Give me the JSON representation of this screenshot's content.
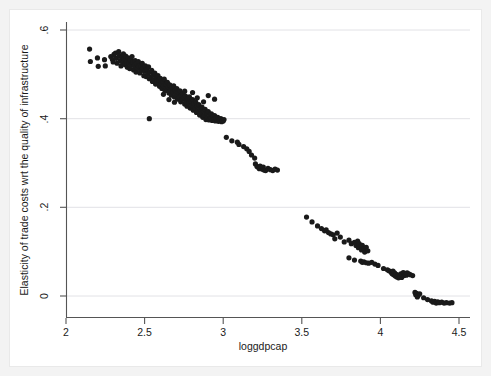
{
  "chart_data": {
    "type": "scatter",
    "title": "",
    "xlabel": "loggdpcap",
    "ylabel": "Elasticity of trade costs wrt the quality of infrastructure",
    "xlim": [
      2,
      4.5
    ],
    "ylim": [
      -0.04,
      0.64
    ],
    "xticks": [
      2,
      2.5,
      3,
      3.5,
      4,
      4.5
    ],
    "xtick_labels": [
      "2",
      "2.5",
      "3",
      "3.5",
      "4",
      "4.5"
    ],
    "yticks": [
      0,
      0.2,
      0.4,
      0.6
    ],
    "ytick_labels": [
      "0",
      ".2",
      ".4",
      ".6"
    ],
    "grid": "horizontal",
    "legend": "none",
    "marker": {
      "shape": "circle",
      "color": "#1a1a1a",
      "size_px": 5.2
    },
    "points": [
      [
        2.15,
        0.557
      ],
      [
        2.155,
        0.529
      ],
      [
        2.2,
        0.537
      ],
      [
        2.205,
        0.518
      ],
      [
        2.245,
        0.533
      ],
      [
        2.25,
        0.519
      ],
      [
        2.285,
        0.54
      ],
      [
        2.295,
        0.534
      ],
      [
        2.3,
        0.528
      ],
      [
        2.305,
        0.545
      ],
      [
        2.315,
        0.548
      ],
      [
        2.32,
        0.536
      ],
      [
        2.325,
        0.525
      ],
      [
        2.335,
        0.551
      ],
      [
        2.34,
        0.542
      ],
      [
        2.345,
        0.531
      ],
      [
        2.35,
        0.519
      ],
      [
        2.355,
        0.538
      ],
      [
        2.36,
        0.527
      ],
      [
        2.365,
        0.546
      ],
      [
        2.37,
        0.534
      ],
      [
        2.375,
        0.522
      ],
      [
        2.38,
        0.541
      ],
      [
        2.385,
        0.53
      ],
      [
        2.39,
        0.516
      ],
      [
        2.395,
        0.537
      ],
      [
        2.4,
        0.525
      ],
      [
        2.405,
        0.513
      ],
      [
        2.41,
        0.533
      ],
      [
        2.415,
        0.521
      ],
      [
        2.42,
        0.54
      ],
      [
        2.425,
        0.528
      ],
      [
        2.43,
        0.51
      ],
      [
        2.435,
        0.519
      ],
      [
        2.44,
        0.531
      ],
      [
        2.445,
        0.505
      ],
      [
        2.45,
        0.524
      ],
      [
        2.455,
        0.513
      ],
      [
        2.46,
        0.529
      ],
      [
        2.465,
        0.518
      ],
      [
        2.47,
        0.503
      ],
      [
        2.475,
        0.521
      ],
      [
        2.48,
        0.509
      ],
      [
        2.485,
        0.525
      ],
      [
        2.49,
        0.514
      ],
      [
        2.495,
        0.497
      ],
      [
        2.5,
        0.507
      ],
      [
        2.505,
        0.519
      ],
      [
        2.51,
        0.495
      ],
      [
        2.515,
        0.511
      ],
      [
        2.52,
        0.501
      ],
      [
        2.525,
        0.517
      ],
      [
        2.53,
        0.49
      ],
      [
        2.535,
        0.505
      ],
      [
        2.54,
        0.494
      ],
      [
        2.545,
        0.509
      ],
      [
        2.55,
        0.484
      ],
      [
        2.555,
        0.499
      ],
      [
        2.56,
        0.488
      ],
      [
        2.565,
        0.503
      ],
      [
        2.57,
        0.478
      ],
      [
        2.575,
        0.493
      ],
      [
        2.58,
        0.482
      ],
      [
        2.585,
        0.497
      ],
      [
        2.59,
        0.487
      ],
      [
        2.595,
        0.473
      ],
      [
        2.6,
        0.491
      ],
      [
        2.605,
        0.479
      ],
      [
        2.61,
        0.468
      ],
      [
        2.615,
        0.484
      ],
      [
        2.62,
        0.474
      ],
      [
        2.625,
        0.489
      ],
      [
        2.63,
        0.463
      ],
      [
        2.635,
        0.478
      ],
      [
        2.64,
        0.468
      ],
      [
        2.645,
        0.482
      ],
      [
        2.65,
        0.472
      ],
      [
        2.655,
        0.458
      ],
      [
        2.66,
        0.476
      ],
      [
        2.665,
        0.465
      ],
      [
        2.67,
        0.453
      ],
      [
        2.675,
        0.47
      ],
      [
        2.68,
        0.46
      ],
      [
        2.685,
        0.474
      ],
      [
        2.69,
        0.449
      ],
      [
        2.695,
        0.464
      ],
      [
        2.7,
        0.454
      ],
      [
        2.705,
        0.468
      ],
      [
        2.71,
        0.444
      ],
      [
        2.715,
        0.459
      ],
      [
        2.72,
        0.449
      ],
      [
        2.725,
        0.463
      ],
      [
        2.73,
        0.438
      ],
      [
        2.735,
        0.453
      ],
      [
        2.74,
        0.443
      ],
      [
        2.745,
        0.457
      ],
      [
        2.75,
        0.447
      ],
      [
        2.755,
        0.433
      ],
      [
        2.76,
        0.451
      ],
      [
        2.765,
        0.44
      ],
      [
        2.77,
        0.428
      ],
      [
        2.775,
        0.445
      ],
      [
        2.78,
        0.435
      ],
      [
        2.785,
        0.449
      ],
      [
        2.79,
        0.424
      ],
      [
        2.795,
        0.439
      ],
      [
        2.8,
        0.429
      ],
      [
        2.805,
        0.443
      ],
      [
        2.81,
        0.419
      ],
      [
        2.815,
        0.434
      ],
      [
        2.82,
        0.424
      ],
      [
        2.825,
        0.438
      ],
      [
        2.83,
        0.414
      ],
      [
        2.835,
        0.428
      ],
      [
        2.84,
        0.418
      ],
      [
        2.845,
        0.432
      ],
      [
        2.85,
        0.408
      ],
      [
        2.855,
        0.422
      ],
      [
        2.86,
        0.412
      ],
      [
        2.865,
        0.426
      ],
      [
        2.87,
        0.403
      ],
      [
        2.875,
        0.417
      ],
      [
        2.88,
        0.407
      ],
      [
        2.885,
        0.421
      ],
      [
        2.89,
        0.398
      ],
      [
        2.895,
        0.412
      ],
      [
        2.9,
        0.402
      ],
      [
        2.905,
        0.416
      ],
      [
        2.91,
        0.397
      ],
      [
        2.915,
        0.407
      ],
      [
        2.92,
        0.4
      ],
      [
        2.925,
        0.411
      ],
      [
        2.93,
        0.396
      ],
      [
        2.935,
        0.404
      ],
      [
        2.94,
        0.398
      ],
      [
        2.945,
        0.407
      ],
      [
        2.95,
        0.395
      ],
      [
        2.955,
        0.401
      ],
      [
        2.96,
        0.397
      ],
      [
        2.965,
        0.403
      ],
      [
        2.97,
        0.394
      ],
      [
        2.975,
        0.399
      ],
      [
        2.98,
        0.396
      ],
      [
        2.985,
        0.4
      ],
      [
        2.99,
        0.393
      ],
      [
        2.995,
        0.397
      ],
      [
        3.0,
        0.395
      ],
      [
        3.005,
        0.398
      ],
      [
        2.53,
        0.4
      ],
      [
        2.62,
        0.455
      ],
      [
        2.655,
        0.443
      ],
      [
        2.69,
        0.437
      ],
      [
        2.755,
        0.462
      ],
      [
        2.805,
        0.459
      ],
      [
        2.835,
        0.447
      ],
      [
        2.875,
        0.438
      ],
      [
        2.905,
        0.452
      ],
      [
        2.945,
        0.444
      ],
      [
        3.02,
        0.358
      ],
      [
        3.055,
        0.35
      ],
      [
        3.09,
        0.347
      ],
      [
        3.1,
        0.342
      ],
      [
        3.13,
        0.337
      ],
      [
        3.15,
        0.332
      ],
      [
        3.165,
        0.326
      ],
      [
        3.18,
        0.318
      ],
      [
        3.2,
        0.311
      ],
      [
        3.205,
        0.298
      ],
      [
        3.215,
        0.292
      ],
      [
        3.225,
        0.29
      ],
      [
        3.23,
        0.287
      ],
      [
        3.235,
        0.293
      ],
      [
        3.24,
        0.288
      ],
      [
        3.25,
        0.286
      ],
      [
        3.255,
        0.291
      ],
      [
        3.26,
        0.284
      ],
      [
        3.27,
        0.283
      ],
      [
        3.285,
        0.288
      ],
      [
        3.3,
        0.285
      ],
      [
        3.315,
        0.283
      ],
      [
        3.33,
        0.286
      ],
      [
        3.345,
        0.284
      ],
      [
        3.53,
        0.178
      ],
      [
        3.565,
        0.167
      ],
      [
        3.6,
        0.158
      ],
      [
        3.625,
        0.152
      ],
      [
        3.645,
        0.147
      ],
      [
        3.655,
        0.149
      ],
      [
        3.67,
        0.143
      ],
      [
        3.685,
        0.14
      ],
      [
        3.7,
        0.138
      ],
      [
        3.71,
        0.129
      ],
      [
        3.725,
        0.142
      ],
      [
        3.745,
        0.133
      ],
      [
        3.77,
        0.122
      ],
      [
        3.8,
        0.126
      ],
      [
        3.815,
        0.118
      ],
      [
        3.835,
        0.121
      ],
      [
        3.845,
        0.114
      ],
      [
        3.855,
        0.124
      ],
      [
        3.86,
        0.109
      ],
      [
        3.865,
        0.118
      ],
      [
        3.875,
        0.112
      ],
      [
        3.88,
        0.104
      ],
      [
        3.885,
        0.114
      ],
      [
        3.895,
        0.107
      ],
      [
        3.9,
        0.099
      ],
      [
        3.91,
        0.11
      ],
      [
        3.92,
        0.102
      ],
      [
        3.8,
        0.086
      ],
      [
        3.835,
        0.081
      ],
      [
        3.875,
        0.079
      ],
      [
        3.885,
        0.076
      ],
      [
        3.895,
        0.077
      ],
      [
        3.91,
        0.075
      ],
      [
        3.925,
        0.074
      ],
      [
        3.945,
        0.076
      ],
      [
        3.965,
        0.072
      ],
      [
        3.985,
        0.069
      ],
      [
        4.02,
        0.062
      ],
      [
        4.045,
        0.059
      ],
      [
        4.055,
        0.057
      ],
      [
        4.065,
        0.055
      ],
      [
        4.07,
        0.053
      ],
      [
        4.075,
        0.05
      ],
      [
        4.08,
        0.056
      ],
      [
        4.085,
        0.048
      ],
      [
        4.09,
        0.052
      ],
      [
        4.095,
        0.045
      ],
      [
        4.1,
        0.049
      ],
      [
        4.105,
        0.043
      ],
      [
        4.11,
        0.047
      ],
      [
        4.115,
        0.041
      ],
      [
        4.12,
        0.046
      ],
      [
        4.125,
        0.044
      ],
      [
        4.13,
        0.05
      ],
      [
        4.135,
        0.042
      ],
      [
        4.14,
        0.048
      ],
      [
        4.145,
        0.053
      ],
      [
        4.15,
        0.046
      ],
      [
        4.155,
        0.051
      ],
      [
        4.16,
        0.049
      ],
      [
        4.165,
        0.047
      ],
      [
        4.17,
        0.052
      ],
      [
        4.18,
        0.05
      ],
      [
        4.19,
        0.048
      ],
      [
        4.205,
        0.046
      ],
      [
        4.22,
        0.008
      ],
      [
        4.225,
        0.003
      ],
      [
        4.23,
        0.006
      ],
      [
        4.235,
        -0.002
      ],
      [
        4.24,
        0.001
      ],
      [
        4.25,
        0.005
      ],
      [
        4.275,
        -0.004
      ],
      [
        4.3,
        -0.008
      ],
      [
        4.325,
        -0.011
      ],
      [
        4.335,
        -0.014
      ],
      [
        4.345,
        -0.012
      ],
      [
        4.355,
        -0.016
      ],
      [
        4.365,
        -0.013
      ],
      [
        4.375,
        -0.015
      ],
      [
        4.39,
        -0.014
      ],
      [
        4.405,
        -0.016
      ],
      [
        4.42,
        -0.015
      ],
      [
        4.44,
        -0.016
      ],
      [
        4.455,
        -0.015
      ]
    ]
  }
}
